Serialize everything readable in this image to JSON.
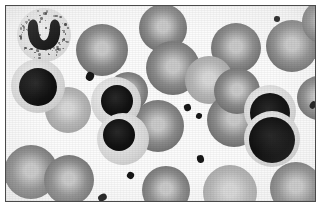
{
  "figure": {
    "specimen_label": "blood-smear",
    "modality": "light-microscopy",
    "staining": "grayscale",
    "frame": {
      "border_color": "#4a4a4a",
      "background_color": "#fcfcfc",
      "matte_color": "#ffffff",
      "x": 5,
      "y": 5,
      "width": 311,
      "height": 197
    }
  },
  "palette": {
    "background": "#fcfcfc",
    "rbc_dark_rim": "#6e6e6e",
    "rbc_mid": "#8d8d8d",
    "rbc_pale": "#c9c9c9",
    "rbc_light_rim": "#a6a6a6",
    "rbc_light_mid": "#b8b8b8",
    "rbc_light_pale": "#d8d8d8",
    "nucleus_dark": "#101010",
    "cytoplasm_pale": "#e2e2e2",
    "platelet": "#171717",
    "frame_border": "#4a4a4a"
  },
  "legend": {
    "erythrocyte_label": "erythrocyte",
    "lymphocyte_label": "lymphocyte",
    "neutrophil_label": "band neutrophil",
    "platelet_label": "platelet"
  },
  "cells": {
    "erythrocytes": [
      {
        "id": "rbc-01",
        "cx": 96,
        "cy": 44,
        "r": 26,
        "tone": "mid"
      },
      {
        "id": "rbc-02",
        "cx": 157,
        "cy": 22,
        "r": 24,
        "tone": "mid"
      },
      {
        "id": "rbc-03",
        "cx": 167,
        "cy": 62,
        "r": 27,
        "tone": "mid"
      },
      {
        "id": "rbc-04",
        "cx": 230,
        "cy": 42,
        "r": 25,
        "tone": "mid"
      },
      {
        "id": "rbc-05",
        "cx": 286,
        "cy": 40,
        "r": 26,
        "tone": "mid"
      },
      {
        "id": "rbc-06",
        "cx": 318,
        "cy": 16,
        "r": 22,
        "tone": "mid"
      },
      {
        "id": "rbc-07",
        "cx": 203,
        "cy": 74,
        "r": 24,
        "tone": "light"
      },
      {
        "id": "rbc-08",
        "cx": 62,
        "cy": 104,
        "r": 23,
        "tone": "light"
      },
      {
        "id": "rbc-09",
        "cx": 152,
        "cy": 120,
        "r": 26,
        "tone": "mid"
      },
      {
        "id": "rbc-10",
        "cx": 228,
        "cy": 114,
        "r": 27,
        "tone": "mid"
      },
      {
        "id": "rbc-11",
        "cx": 231,
        "cy": 85,
        "r": 23,
        "tone": "mid"
      },
      {
        "id": "rbc-12",
        "cx": 25,
        "cy": 166,
        "r": 27,
        "tone": "mid"
      },
      {
        "id": "rbc-13",
        "cx": 63,
        "cy": 174,
        "r": 25,
        "tone": "mid"
      },
      {
        "id": "rbc-14",
        "cx": 160,
        "cy": 184,
        "r": 24,
        "tone": "mid"
      },
      {
        "id": "rbc-15",
        "cx": 224,
        "cy": 186,
        "r": 27,
        "tone": "light"
      },
      {
        "id": "rbc-16",
        "cx": 290,
        "cy": 182,
        "r": 26,
        "tone": "mid"
      },
      {
        "id": "rbc-17",
        "cx": 313,
        "cy": 92,
        "r": 22,
        "tone": "mid"
      },
      {
        "id": "rbc-18",
        "cx": 122,
        "cy": 86,
        "r": 20,
        "tone": "mid"
      }
    ],
    "lymphocytes": [
      {
        "id": "lym-01",
        "cx": 32,
        "cy": 80,
        "r": 27,
        "nucleus_r": 19,
        "nucleus_dx": 0,
        "nucleus_dy": 1
      },
      {
        "id": "lym-02",
        "cx": 110,
        "cy": 96,
        "r": 25,
        "nucleus_r": 16,
        "nucleus_dx": 1,
        "nucleus_dy": -1
      },
      {
        "id": "lym-03",
        "cx": 117,
        "cy": 133,
        "r": 26,
        "nucleus_r": 16,
        "nucleus_dx": -4,
        "nucleus_dy": -4
      },
      {
        "id": "lym-04",
        "cx": 264,
        "cy": 105,
        "r": 26,
        "nucleus_r": 20,
        "nucleus_dx": 0,
        "nucleus_dy": 2
      },
      {
        "id": "lym-05",
        "cx": 266,
        "cy": 133,
        "r": 28,
        "nucleus_r": 23,
        "nucleus_dx": 0,
        "nucleus_dy": 1
      }
    ],
    "neutrophils": [
      {
        "id": "neu-01",
        "cx": 38,
        "cy": 29,
        "r": 27,
        "nucleus_shape": "u-shaped-band",
        "granule_count": 120
      }
    ],
    "platelets": [
      {
        "id": "plt-01",
        "cx": 84,
        "cy": 70,
        "w": 8,
        "h": 9,
        "rot": 18
      },
      {
        "id": "plt-02",
        "cx": 181,
        "cy": 101,
        "w": 7,
        "h": 7,
        "rot": -22
      },
      {
        "id": "plt-03",
        "cx": 307,
        "cy": 99,
        "w": 6,
        "h": 8,
        "rot": 30
      },
      {
        "id": "plt-04",
        "cx": 193,
        "cy": 110,
        "w": 6,
        "h": 6,
        "rot": 10
      },
      {
        "id": "plt-05",
        "cx": 194,
        "cy": 153,
        "w": 7,
        "h": 8,
        "rot": -15
      },
      {
        "id": "plt-06",
        "cx": 124,
        "cy": 169,
        "w": 7,
        "h": 7,
        "rot": 25
      },
      {
        "id": "plt-07",
        "cx": 96,
        "cy": 191,
        "w": 9,
        "h": 7,
        "rot": -30
      },
      {
        "id": "plt-08",
        "cx": 271,
        "cy": 13,
        "w": 6,
        "h": 6,
        "rot": 0
      }
    ]
  }
}
